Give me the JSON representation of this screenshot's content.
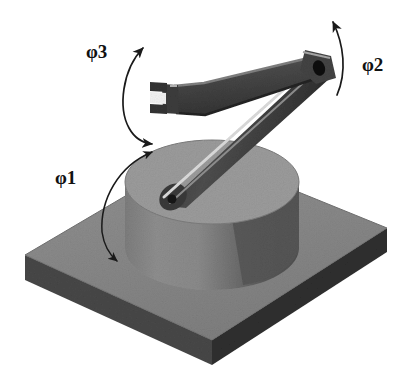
{
  "figure": {
    "background_color": "#ffffff",
    "width": 412,
    "height": 386
  },
  "labels": {
    "phi1": {
      "symbol": "φ",
      "subscript": "1",
      "text": "φ1"
    },
    "phi2": {
      "symbol": "φ",
      "subscript": "2",
      "text": "φ2"
    },
    "phi3": {
      "symbol": "φ",
      "subscript": "3",
      "text": "φ3"
    }
  },
  "colors": {
    "background": "#ffffff",
    "plate_top": "#8a8a8a",
    "plate_edge_front": "#3a3a3a",
    "plate_edge_right": "#4a4a4a",
    "cylinder_top": "#9a9a9a",
    "cylinder_body_light": "#8b8b8b",
    "cylinder_body_dark": "#5e5e5e",
    "arm_dark": "#3b3b3b",
    "arm_mid": "#565656",
    "arm_highlight": "#d6d6d6",
    "arrow_stroke": "#1a1a1a",
    "label_text": "#111111"
  },
  "parts": {
    "base_plate": {
      "name": "base plate",
      "shape": "isometric slab"
    },
    "column": {
      "name": "rotating column",
      "shape": "cylinder"
    },
    "lower_arm": {
      "name": "lower link",
      "shape": "beam"
    },
    "upper_arm": {
      "name": "upper link",
      "shape": "beam"
    },
    "elbow_joint": {
      "name": "elbow pivot",
      "shape": "pin hole"
    },
    "gripper": {
      "name": "fork gripper",
      "shape": "two-prong fork"
    }
  },
  "arrows": {
    "phi1": {
      "name": "base rotation arrow",
      "heads": "double"
    },
    "phi2": {
      "name": "shoulder rotation arrow",
      "heads": "single"
    },
    "phi3": {
      "name": "elbow rotation arrow",
      "heads": "double"
    }
  }
}
